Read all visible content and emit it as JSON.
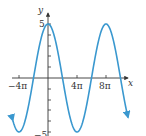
{
  "chart_data": {
    "type": "line",
    "title": "",
    "xlabel": "x",
    "ylabel": "y",
    "function": "y = 5 cos(x/4)",
    "amplitude": 5,
    "period_label": "8π",
    "x_range_radians": [
      -15.2,
      34.7
    ],
    "ylim": [
      -5,
      5
    ],
    "x_ticks": [
      {
        "value": -12.566,
        "label": "−4π"
      },
      {
        "value": 12.566,
        "label": "4π"
      },
      {
        "value": 25.133,
        "label": "8π"
      }
    ],
    "y_ticks": [
      1,
      2,
      3,
      4,
      5,
      -1,
      -2,
      -3,
      -4,
      -5
    ],
    "y_tick_labels": [
      {
        "value": 5,
        "label": "5"
      },
      {
        "value": -5,
        "label": "−5"
      }
    ],
    "key_points": [
      {
        "x_label": "−4π",
        "y": -5
      },
      {
        "x_label": "−2π",
        "y": 0
      },
      {
        "x_label": "0",
        "y": 5
      },
      {
        "x_label": "2π",
        "y": 0
      },
      {
        "x_label": "4π",
        "y": -5
      },
      {
        "x_label": "6π",
        "y": 0
      },
      {
        "x_label": "8π",
        "y": 5
      },
      {
        "x_label": "10π",
        "y": 0
      }
    ],
    "arrows_on_ends": true,
    "grid": false,
    "legend": null
  },
  "colors": {
    "curve": "#3a98cf",
    "axes": "#333333"
  },
  "labels": {
    "x_axis": "x",
    "y_axis": "y",
    "y_top": "5",
    "y_bottom": "−5",
    "x_neg4pi": "−4π",
    "x_4pi": "4π",
    "x_8pi": "8π"
  }
}
